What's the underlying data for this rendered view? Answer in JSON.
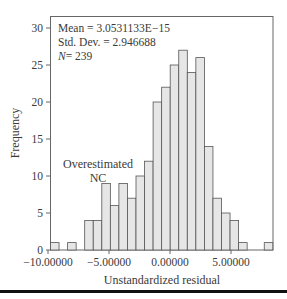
{
  "chart_data": {
    "type": "bar",
    "subtype": "histogram",
    "title": "",
    "xlabel": "Unstandardized residual",
    "ylabel": "Frequency",
    "ylim": [
      0,
      31.5
    ],
    "yticks": [
      0,
      5,
      10,
      15,
      20,
      25,
      30
    ],
    "xticks": [
      -10,
      -5,
      0,
      5
    ],
    "xtick_labels": [
      "-10.00000",
      "-5.00000",
      "0.00000",
      "5.00000"
    ],
    "grid": false,
    "bin_width": 0.6965,
    "bin_start": -9.86,
    "values": [
      1,
      0,
      1,
      0,
      4,
      4,
      9,
      6,
      9,
      7,
      10,
      12,
      20,
      22,
      25,
      27,
      24,
      26,
      14,
      7,
      5,
      4,
      1,
      0,
      0,
      1
    ],
    "stats": {
      "mean": "Mean = 3.0531133E−15",
      "std": "Std. Dev. = 2.946688",
      "n_label": "N",
      "n_value": "= 239"
    },
    "annotation": [
      "Overestimated",
      "NC"
    ],
    "colors": {
      "bar_fill": "#e6e6e6",
      "bar_stroke": "#555555",
      "axis": "#555555"
    }
  }
}
